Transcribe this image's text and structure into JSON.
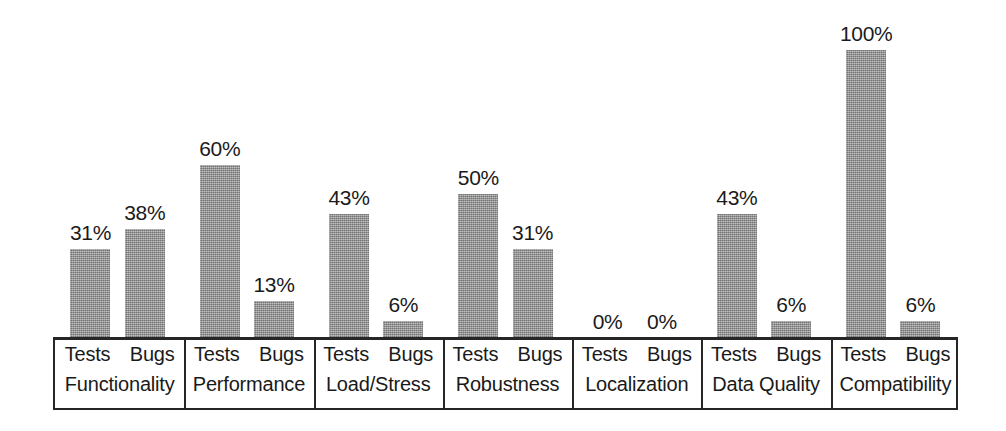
{
  "chart_data": {
    "type": "bar",
    "title": "",
    "subtitle": "",
    "xlabel": "",
    "ylabel": "",
    "ylim": [
      0,
      100
    ],
    "grid": false,
    "legend_position": "none",
    "value_suffix": "%",
    "series_labels": [
      "Tests",
      "Bugs"
    ],
    "categories": [
      "Functionality",
      "Performance",
      "Load/Stress",
      "Robustness",
      "Localization",
      "Data Quality",
      "Compatibility"
    ],
    "series": [
      {
        "name": "Tests",
        "values": [
          31,
          60,
          43,
          50,
          0,
          43,
          100
        ]
      },
      {
        "name": "Bugs",
        "values": [
          38,
          13,
          6,
          31,
          0,
          6,
          6
        ]
      }
    ],
    "groups": [
      {
        "category": "Functionality",
        "bars": [
          {
            "series": "Tests",
            "value": 31,
            "label": "31%"
          },
          {
            "series": "Bugs",
            "value": 38,
            "label": "38%"
          }
        ]
      },
      {
        "category": "Performance",
        "bars": [
          {
            "series": "Tests",
            "value": 60,
            "label": "60%"
          },
          {
            "series": "Bugs",
            "value": 13,
            "label": "13%"
          }
        ]
      },
      {
        "category": "Load/Stress",
        "bars": [
          {
            "series": "Tests",
            "value": 43,
            "label": "43%"
          },
          {
            "series": "Bugs",
            "value": 6,
            "label": "6%"
          }
        ]
      },
      {
        "category": "Robustness",
        "bars": [
          {
            "series": "Tests",
            "value": 50,
            "label": "50%"
          },
          {
            "series": "Bugs",
            "value": 31,
            "label": "31%"
          }
        ]
      },
      {
        "category": "Localization",
        "bars": [
          {
            "series": "Tests",
            "value": 0,
            "label": "0%"
          },
          {
            "series": "Bugs",
            "value": 0,
            "label": "0%"
          }
        ]
      },
      {
        "category": "Data Quality",
        "bars": [
          {
            "series": "Tests",
            "value": 43,
            "label": "43%"
          },
          {
            "series": "Bugs",
            "value": 6,
            "label": "6%"
          }
        ]
      },
      {
        "category": "Compatibility",
        "bars": [
          {
            "series": "Tests",
            "value": 100,
            "label": "100%"
          },
          {
            "series": "Bugs",
            "value": 6,
            "label": "6%"
          }
        ]
      }
    ],
    "colors": {
      "bar_fill": "#8d8d8d",
      "axis": "#262626",
      "text": "#1a1a1a",
      "background": "#ffffff"
    }
  }
}
